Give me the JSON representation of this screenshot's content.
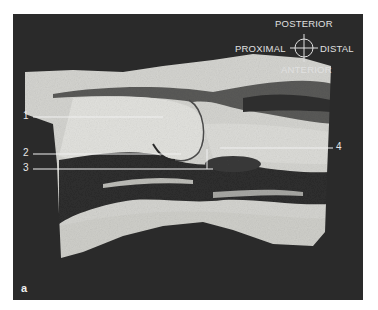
{
  "figure": {
    "panel_letter": "a",
    "orientation": {
      "top": "POSTERIOR",
      "left": "PROXIMAL",
      "right": "DISTAL",
      "bottom": "ANTERIOR"
    },
    "labels": [
      {
        "id": "1"
      },
      {
        "id": "2"
      },
      {
        "id": "3"
      },
      {
        "id": "4"
      }
    ],
    "colors": {
      "background": "#2a2a2a",
      "label_text": "#e8e8e8",
      "tissue_light": "#d9d9d6",
      "tissue_dark": "#3a3a3a"
    }
  }
}
